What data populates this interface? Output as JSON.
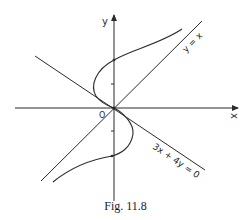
{
  "figure": {
    "caption": "Fig. 11.8",
    "axis_labels": {
      "x": "x",
      "y": "y",
      "origin": "O"
    },
    "line_labels": {
      "diagonal": "y = x",
      "tangent": "3x + 4y = 0"
    },
    "colors": {
      "ink": "#2a2a2a",
      "background": "#ffffff"
    }
  }
}
